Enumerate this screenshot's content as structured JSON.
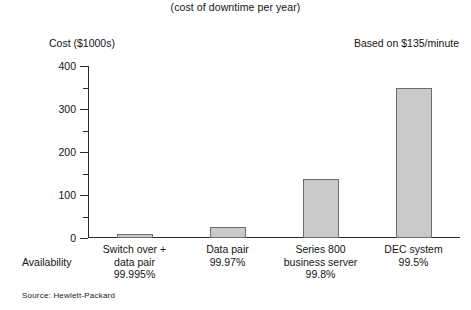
{
  "chart_data": {
    "type": "bar",
    "title": "",
    "subtitle": "(cost of downtime per year)",
    "ylabel": "Cost ($1000s)",
    "xlabel": "Availability",
    "annotation": "Based on $135/minute",
    "source": "Source: Hewlett-Packard",
    "categories": [
      "Switch over +\ndata pair",
      "Data pair",
      "Series 800\nbusiness server",
      "DEC system"
    ],
    "category_lines": [
      [
        "Switch over +",
        "data pair"
      ],
      [
        "Data pair"
      ],
      [
        "Series 800",
        "business server"
      ],
      [
        "DEC system"
      ]
    ],
    "category_pcts": [
      "99.995%",
      "99.97%",
      "99.8%",
      "99.5%"
    ],
    "values": [
      10,
      25,
      138,
      350
    ],
    "ylim": [
      0,
      400
    ],
    "ytick_labels": [
      "0",
      "100",
      "200",
      "300",
      "400"
    ],
    "ytick_values": [
      0,
      100,
      200,
      300,
      400
    ],
    "yminor_values": [
      50,
      150,
      250,
      350
    ],
    "grid": false,
    "legend": "none",
    "bar_color": "#c9c9c9",
    "bar_border_color": "#6d6d6d",
    "axis_color": "#2b2b2b"
  },
  "labels": {
    "subtitle": "(cost of downtime per year)",
    "y_axis_title": "Cost ($1000s)",
    "annotation": "Based on $135/minute",
    "availability": "Availability",
    "source": "Source: Hewlett-Packard"
  }
}
